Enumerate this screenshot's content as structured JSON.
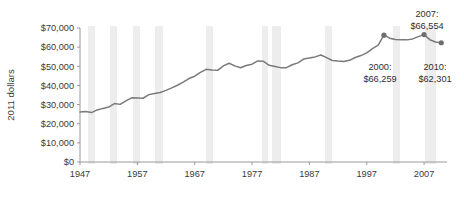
{
  "chart_data": {
    "type": "line",
    "title": "",
    "subtitle": "",
    "xlabel": "",
    "ylabel": "2011 dollars",
    "xlim": [
      1947,
      2011
    ],
    "ylim": [
      0,
      70000
    ],
    "grid": false,
    "legend": "none",
    "x_ticks": [
      "1947",
      "1957",
      "1967",
      "1977",
      "1987",
      "1997",
      "2007"
    ],
    "x_tick_values": [
      1947,
      1957,
      1967,
      1977,
      1987,
      1997,
      2007
    ],
    "y_ticks": [
      "$0",
      "$10,000",
      "$20,000",
      "$30,000",
      "$40,000",
      "$50,000",
      "$60,000",
      "$70,000"
    ],
    "y_tick_values": [
      0,
      10000,
      20000,
      30000,
      40000,
      50000,
      60000,
      70000
    ],
    "series": [
      {
        "name": "Median household income",
        "color": "#7a7a7a",
        "x": [
          1947,
          1948,
          1949,
          1950,
          1951,
          1952,
          1953,
          1954,
          1955,
          1956,
          1957,
          1958,
          1959,
          1960,
          1961,
          1962,
          1963,
          1964,
          1965,
          1966,
          1967,
          1968,
          1969,
          1970,
          1971,
          1972,
          1973,
          1974,
          1975,
          1976,
          1977,
          1978,
          1979,
          1980,
          1981,
          1982,
          1983,
          1984,
          1985,
          1986,
          1987,
          1988,
          1989,
          1990,
          1991,
          1992,
          1993,
          1994,
          1995,
          1996,
          1997,
          1998,
          1999,
          2000,
          2001,
          2002,
          2003,
          2004,
          2005,
          2006,
          2007,
          2008,
          2009,
          2010
        ],
        "values": [
          26100,
          26400,
          25800,
          27200,
          28000,
          28700,
          30500,
          30100,
          31900,
          33500,
          33400,
          33300,
          35200,
          35800,
          36300,
          37400,
          38700,
          40100,
          41700,
          43600,
          44800,
          46800,
          48400,
          48000,
          47900,
          50200,
          51600,
          50200,
          49200,
          50400,
          51100,
          52800,
          52600,
          50500,
          49900,
          49300,
          49300,
          50800,
          51800,
          53800,
          54300,
          54900,
          55900,
          54500,
          53000,
          52700,
          52500,
          53100,
          54600,
          55600,
          57000,
          59200,
          61000,
          66259,
          64700,
          64000,
          63900,
          63800,
          64300,
          65500,
          66554,
          63900,
          62700,
          62301
        ]
      }
    ],
    "markers": [
      {
        "label_year": "2000:",
        "label_value": "$66,259",
        "x": 2000,
        "y": 66259,
        "text_anchor_x": 380,
        "text_y": 70,
        "text_align": "middle"
      },
      {
        "label_year": "2007:",
        "label_value": "$66,554",
        "x": 2007,
        "y": 66554,
        "text_anchor_x": 427,
        "text_y": 17,
        "text_align": "middle"
      },
      {
        "label_year": "2010:",
        "label_value": "$62,301",
        "x": 2010,
        "y": 62301,
        "text_anchor_x": 435,
        "text_y": 70,
        "text_align": "middle"
      }
    ],
    "recession_bands": [
      {
        "x0": 88,
        "x1": 95
      },
      {
        "x0": 110,
        "x1": 117
      },
      {
        "x0": 133,
        "x1": 140
      },
      {
        "x0": 155,
        "x1": 163
      },
      {
        "x0": 206,
        "x1": 213
      },
      {
        "x0": 262,
        "x1": 268
      },
      {
        "x0": 272,
        "x1": 281
      },
      {
        "x0": 325,
        "x1": 332
      },
      {
        "x0": 393,
        "x1": 400
      },
      {
        "x0": 425,
        "x1": 436
      }
    ],
    "band_color": "#ededed",
    "axis_color": "#9a9a9a",
    "marker_color": "#6e6e6e"
  }
}
